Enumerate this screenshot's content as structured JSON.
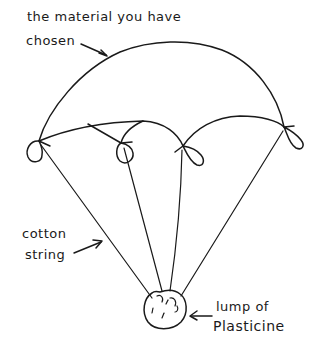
{
  "diagram": {
    "labels": {
      "canopy_line1": "the material you have",
      "canopy_line2": "chosen",
      "string_line1": "cotton",
      "string_line2": "string",
      "weight_line1": "lump of",
      "weight_line2": "Plasticine"
    },
    "parts": [
      {
        "name": "canopy",
        "label": "the material you have chosen"
      },
      {
        "name": "strings",
        "label": "cotton string",
        "count": 4
      },
      {
        "name": "weight",
        "label": "lump of Plasticine"
      },
      {
        "name": "loops",
        "count": 4
      }
    ],
    "ink_color": "#1a1a1a",
    "background": "#ffffff"
  }
}
